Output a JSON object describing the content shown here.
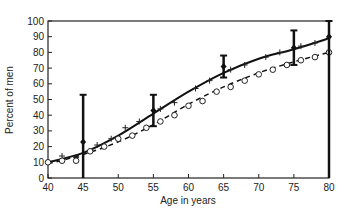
{
  "chart_data": {
    "type": "line",
    "title": "",
    "xlabel": "Age in years",
    "ylabel": "Percent of men",
    "xlim": [
      40,
      80
    ],
    "ylim": [
      0,
      100
    ],
    "xticks": [
      40,
      45,
      50,
      55,
      60,
      65,
      70,
      75,
      80
    ],
    "yticks": [
      0,
      10,
      20,
      30,
      40,
      50,
      60,
      70,
      80,
      90,
      100
    ],
    "grid": false,
    "legend": null,
    "series": [
      {
        "name": "Fitted curve (solid)",
        "style": "solid",
        "x": [
          40,
          45,
          50,
          55,
          60,
          65,
          70,
          75,
          80
        ],
        "values": [
          10,
          16,
          27,
          41,
          55,
          67,
          76,
          82,
          89
        ]
      },
      {
        "name": "Fitted curve (dashed)",
        "style": "dashed",
        "x": [
          40,
          45,
          50,
          55,
          60,
          65,
          70,
          75,
          80
        ],
        "values": [
          9,
          15,
          23,
          34,
          47,
          58,
          67,
          74,
          80
        ]
      },
      {
        "name": "Observed (+)",
        "style": "plus-markers",
        "x": [
          42,
          44,
          47,
          49,
          51,
          53,
          56,
          58,
          61,
          63,
          66,
          68,
          71,
          73,
          76,
          78
        ],
        "values": [
          14,
          13,
          21,
          25,
          32,
          36,
          44,
          48,
          57,
          62,
          69,
          72,
          77,
          80,
          84,
          86
        ]
      },
      {
        "name": "Observed (o)",
        "style": "circle-markers",
        "x": [
          40,
          42,
          44,
          46,
          48,
          50,
          52,
          54,
          56,
          58,
          60,
          62,
          64,
          66,
          68,
          70,
          72,
          74,
          76,
          78,
          80
        ],
        "values": [
          10,
          11,
          11,
          17,
          20,
          25,
          27,
          32,
          36,
          40,
          46,
          49,
          55,
          58,
          62,
          66,
          69,
          72,
          75,
          77,
          80
        ]
      },
      {
        "name": "Points with error bars",
        "style": "errorbar",
        "x": [
          45,
          55,
          65,
          75,
          80
        ],
        "values": [
          23,
          43,
          71,
          83,
          90
        ],
        "lower": [
          0,
          33,
          64,
          72,
          0
        ],
        "upper": [
          53,
          53,
          78,
          94,
          100
        ]
      }
    ]
  }
}
